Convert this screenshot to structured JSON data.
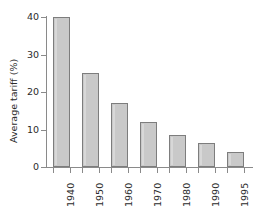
{
  "chart_data": {
    "type": "bar",
    "title": "",
    "subtitle": "",
    "xlabel": "",
    "ylabel": "Average tariff (%)",
    "categories": [
      "1940",
      "1950",
      "1960",
      "1970",
      "1980",
      "1990",
      "1995"
    ],
    "values": [
      40,
      25,
      17,
      12,
      8.5,
      6.5,
      4
    ],
    "ylim": [
      0,
      40
    ],
    "yticks": [
      0,
      10,
      20,
      30,
      40
    ],
    "ytick_labels": [
      "0",
      "10",
      "20",
      "30",
      "40"
    ],
    "grid": false,
    "legend": null,
    "legend_position": "none",
    "annotations": [],
    "series": [
      {
        "name": "Average tariff",
        "values": [
          40,
          25,
          17,
          12,
          8.5,
          6.5,
          4
        ]
      }
    ],
    "colors": {
      "bar_fill": "#c9c9c9",
      "bar_border": "#7d7d7d",
      "axis": "#8a8a8a",
      "text": "#2b2b2b",
      "background": "#ffffff"
    }
  }
}
